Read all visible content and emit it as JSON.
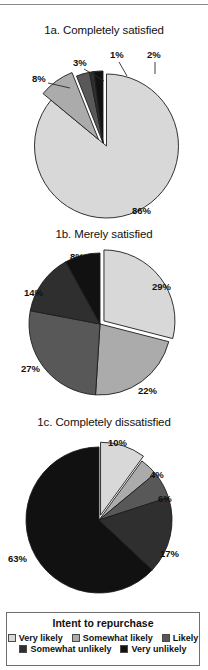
{
  "figure": {
    "legend_title": "Intent to repurchase",
    "categories": [
      "Very likely",
      "Somewhat likely",
      "Likely",
      "Somewhat unlikely",
      "Very unlikely"
    ],
    "colors": [
      "#d8d8d8",
      "#ababab",
      "#585858",
      "#2f2f2f",
      "#111111"
    ]
  },
  "chart_data": [
    {
      "type": "pie",
      "title": "1a. Completely satisfied",
      "categories": [
        "Very likely",
        "Somewhat likely",
        "Likely",
        "Somewhat unlikely",
        "Very unlikely"
      ],
      "values": [
        86,
        8,
        3,
        1,
        2
      ],
      "labels": [
        "86%",
        "8%",
        "3%",
        "1%",
        "2%"
      ],
      "colors": [
        "#d8d8d8",
        "#ababab",
        "#585858",
        "#2f2f2f",
        "#111111"
      ],
      "exploded": [
        true,
        true,
        false,
        false,
        false
      ],
      "start_angle_deg": 0,
      "xlabel": "",
      "ylabel": "",
      "legend": "bottom"
    },
    {
      "type": "pie",
      "title": "1b. Merely satisfied",
      "categories": [
        "Very likely",
        "Somewhat likely",
        "Likely",
        "Somewhat unlikely",
        "Very unlikely"
      ],
      "values": [
        29,
        22,
        27,
        14,
        8
      ],
      "labels": [
        "29%",
        "22%",
        "27%",
        "14%",
        "8%"
      ],
      "colors": [
        "#d8d8d8",
        "#ababab",
        "#585858",
        "#2f2f2f",
        "#111111"
      ],
      "exploded": [
        true,
        false,
        false,
        false,
        false
      ],
      "start_angle_deg": 0,
      "xlabel": "",
      "ylabel": "",
      "legend": "bottom"
    },
    {
      "type": "pie",
      "title": "1c. Completely dissatisfied",
      "categories": [
        "Very likely",
        "Somewhat likely",
        "Likely",
        "Somewhat unlikely",
        "Very unlikely"
      ],
      "values": [
        10,
        4,
        6,
        17,
        63
      ],
      "labels": [
        "10%",
        "4%",
        "6%",
        "17%",
        "63%"
      ],
      "colors": [
        "#d8d8d8",
        "#ababab",
        "#585858",
        "#2f2f2f",
        "#111111"
      ],
      "exploded": [
        true,
        false,
        false,
        false,
        false
      ],
      "start_angle_deg": 0,
      "xlabel": "",
      "ylabel": "",
      "legend": "bottom"
    }
  ],
  "charts": {
    "a": {
      "title": "1a. Completely satisfied",
      "l0": "86%",
      "l1": "8%",
      "l2": "3%",
      "l3": "1%",
      "l4": "2%"
    },
    "b": {
      "title": "1b. Merely satisfied",
      "l0": "29%",
      "l1": "22%",
      "l2": "27%",
      "l3": "14%",
      "l4": "8%"
    },
    "c": {
      "title": "1c. Completely dissatisfied",
      "l0": "10%",
      "l1": "4%",
      "l2": "6%",
      "l3": "17%",
      "l4": "63%"
    }
  },
  "legend": {
    "title": "Intent to repurchase",
    "items": [
      {
        "label": "Very likely",
        "color": "#d8d8d8"
      },
      {
        "label": "Somewhat likely",
        "color": "#ababab"
      },
      {
        "label": "Likely",
        "color": "#585858"
      },
      {
        "label": "Somewhat unlikely",
        "color": "#2f2f2f"
      },
      {
        "label": "Very unlikely",
        "color": "#111111"
      }
    ]
  }
}
